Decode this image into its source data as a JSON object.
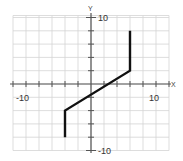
{
  "chart_data": {
    "type": "line",
    "title": "",
    "xlabel": "X",
    "ylabel": "Y",
    "xlim": [
      -12,
      12
    ],
    "ylim": [
      -10,
      10
    ],
    "grid": true,
    "grid_step": 2,
    "tick_labels": {
      "x": [
        {
          "value": -10,
          "label": "-10"
        },
        {
          "value": 10,
          "label": "10"
        }
      ],
      "y": [
        {
          "value": 10,
          "label": "10"
        },
        {
          "value": -10,
          "label": "-10"
        }
      ]
    },
    "series": [
      {
        "name": "piecewise function",
        "color": "#111111",
        "points": [
          {
            "x": -4,
            "y": -8
          },
          {
            "x": -4,
            "y": -4
          },
          {
            "x": 6,
            "y": 2
          },
          {
            "x": 6,
            "y": 8
          }
        ]
      }
    ],
    "legend": null
  },
  "labels": {
    "x_axis": "X",
    "y_axis": "Y",
    "x_min": "-10",
    "x_max": "10",
    "y_max": "10",
    "y_min": "-10"
  }
}
